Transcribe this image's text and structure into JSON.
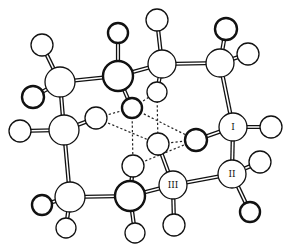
{
  "diagram": {
    "type": "ball-and-stick molecular model",
    "atoms": [
      {
        "id": "h1",
        "x": 42,
        "y": 45,
        "r": 11,
        "bold": false,
        "label": ""
      },
      {
        "id": "c1",
        "x": 60,
        "y": 82,
        "r": 15,
        "bold": false,
        "label": ""
      },
      {
        "id": "h2",
        "x": 33,
        "y": 97,
        "r": 11,
        "bold": true,
        "label": ""
      },
      {
        "id": "c2",
        "x": 118,
        "y": 76,
        "r": 15,
        "bold": true,
        "label": ""
      },
      {
        "id": "h3",
        "x": 118,
        "y": 33,
        "r": 10,
        "bold": true,
        "label": ""
      },
      {
        "id": "c3",
        "x": 162,
        "y": 64,
        "r": 14,
        "bold": false,
        "label": ""
      },
      {
        "id": "h4",
        "x": 157,
        "y": 20,
        "r": 11,
        "bold": false,
        "label": ""
      },
      {
        "id": "c4",
        "x": 220,
        "y": 63,
        "r": 14,
        "bold": false,
        "label": ""
      },
      {
        "id": "h5",
        "x": 226,
        "y": 29,
        "r": 11,
        "bold": true,
        "label": ""
      },
      {
        "id": "h6",
        "x": 248,
        "y": 54,
        "r": 11,
        "bold": false,
        "label": ""
      },
      {
        "id": "h7",
        "x": 157,
        "y": 92,
        "r": 10,
        "bold": false,
        "label": ""
      },
      {
        "id": "h8",
        "x": 96,
        "y": 118,
        "r": 11,
        "bold": false,
        "label": ""
      },
      {
        "id": "c5",
        "x": 64,
        "y": 130,
        "r": 15,
        "bold": false,
        "label": ""
      },
      {
        "id": "h9",
        "x": 20,
        "y": 131,
        "r": 11,
        "bold": false,
        "label": ""
      },
      {
        "id": "h10",
        "x": 132,
        "y": 108,
        "r": 10,
        "bold": true,
        "label": ""
      },
      {
        "id": "h11",
        "x": 158,
        "y": 144,
        "r": 11,
        "bold": false,
        "label": ""
      },
      {
        "id": "n1",
        "x": 233,
        "y": 127,
        "r": 14,
        "bold": false,
        "label": "I"
      },
      {
        "id": "h12",
        "x": 271,
        "y": 127,
        "r": 11,
        "bold": false,
        "label": ""
      },
      {
        "id": "h13",
        "x": 196,
        "y": 140,
        "r": 11,
        "bold": true,
        "label": ""
      },
      {
        "id": "h14",
        "x": 133,
        "y": 166,
        "r": 11,
        "bold": false,
        "label": ""
      },
      {
        "id": "c6",
        "x": 70,
        "y": 197,
        "r": 15,
        "bold": false,
        "label": ""
      },
      {
        "id": "h15",
        "x": 42,
        "y": 205,
        "r": 10,
        "bold": true,
        "label": ""
      },
      {
        "id": "h16",
        "x": 66,
        "y": 228,
        "r": 10,
        "bold": false,
        "label": ""
      },
      {
        "id": "c7",
        "x": 130,
        "y": 196,
        "r": 15,
        "bold": true,
        "label": ""
      },
      {
        "id": "h17",
        "x": 135,
        "y": 233,
        "r": 10,
        "bold": false,
        "label": ""
      },
      {
        "id": "n3",
        "x": 173,
        "y": 185,
        "r": 14,
        "bold": false,
        "label": "III"
      },
      {
        "id": "h18",
        "x": 174,
        "y": 225,
        "r": 11,
        "bold": false,
        "label": ""
      },
      {
        "id": "n2",
        "x": 232,
        "y": 174,
        "r": 14,
        "bold": false,
        "label": "II"
      },
      {
        "id": "h19",
        "x": 260,
        "y": 162,
        "r": 11,
        "bold": false,
        "label": ""
      },
      {
        "id": "h20",
        "x": 250,
        "y": 212,
        "r": 10,
        "bold": true,
        "label": ""
      }
    ],
    "bonds": [
      [
        "h1",
        "c1"
      ],
      [
        "h2",
        "c1"
      ],
      [
        "c1",
        "c2"
      ],
      [
        "c1",
        "c5"
      ],
      [
        "h3",
        "c2"
      ],
      [
        "c2",
        "c3"
      ],
      [
        "c2",
        "h10"
      ],
      [
        "h4",
        "c3"
      ],
      [
        "c3",
        "c4"
      ],
      [
        "c3",
        "h7"
      ],
      [
        "h5",
        "c4"
      ],
      [
        "h6",
        "c4"
      ],
      [
        "c4",
        "n1"
      ],
      [
        "h9",
        "c5"
      ],
      [
        "c5",
        "h8"
      ],
      [
        "c5",
        "c6"
      ],
      [
        "n1",
        "h12"
      ],
      [
        "n1",
        "h13"
      ],
      [
        "n1",
        "n2"
      ],
      [
        "h15",
        "c6"
      ],
      [
        "h16",
        "c6"
      ],
      [
        "c6",
        "c7"
      ],
      [
        "c7",
        "h14"
      ],
      [
        "c7",
        "h17"
      ],
      [
        "c7",
        "n3"
      ],
      [
        "n3",
        "h11"
      ],
      [
        "n3",
        "h18"
      ],
      [
        "n3",
        "n2"
      ],
      [
        "n2",
        "h19"
      ],
      [
        "n2",
        "h20"
      ]
    ],
    "hydrogen_bonds": [
      [
        "h8",
        "h10"
      ],
      [
        "h8",
        "h11"
      ],
      [
        "h10",
        "h7"
      ],
      [
        "h10",
        "h13"
      ],
      [
        "h7",
        "h11"
      ],
      [
        "h10",
        "h14"
      ],
      [
        "h11",
        "h13"
      ],
      [
        "h14",
        "h13"
      ]
    ],
    "labels": {
      "n1": "I",
      "n2": "II",
      "n3": "III"
    }
  }
}
